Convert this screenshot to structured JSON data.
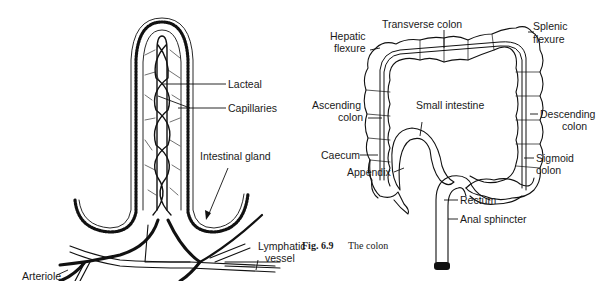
{
  "villus": {
    "labels": {
      "lacteal": "Lacteal",
      "capillaries": "Capillaries",
      "intestinal_gland": "Intestinal gland",
      "lymphatic_vessel_1": "Lymphatic",
      "lymphatic_vessel_2": "vessel",
      "arteriole": "Arteriole"
    }
  },
  "colon": {
    "labels": {
      "transverse_colon": "Transverse colon",
      "hepatic_flexure_1": "Hepatic",
      "hepatic_flexure_2": "flexure",
      "splenic_flexure_1": "Splenic",
      "splenic_flexure_2": "flexure",
      "ascending_colon_1": "Ascending",
      "ascending_colon_2": "colon",
      "small_intestine": "Small intestine",
      "descending_colon_1": "Descending",
      "descending_colon_2": "colon",
      "caecum": "Caecum",
      "appendix": "Appendix",
      "sigmoid_colon_1": "Sigmoid",
      "sigmoid_colon_2": "colon",
      "rectum": "Rectum",
      "anal_sphincter": "Anal sphincter"
    },
    "caption": {
      "number": "Fig. 6.9",
      "text": "The colon"
    }
  }
}
